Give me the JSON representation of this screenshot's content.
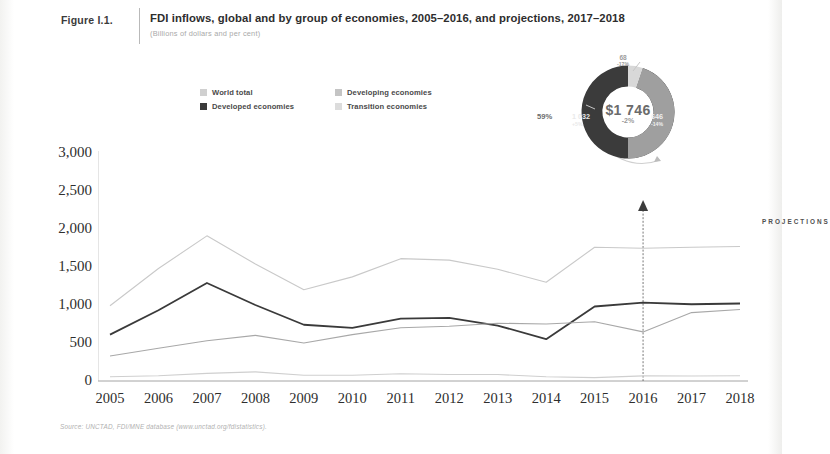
{
  "figure": {
    "label": "Figure I.1.",
    "title": "FDI inflows, global and by group of economies, 2005–2016, and projections, 2017–2018",
    "subtitle": "(Billions of dollars and per cent)",
    "source": "Source:  UNCTAD, FDI/MNE database (www.unctad.org/fdistatistics)."
  },
  "legend": {
    "items": [
      {
        "label": "World total",
        "color": "#d0d0d0"
      },
      {
        "label": "Developing economies",
        "color": "#c4c4c4"
      },
      {
        "label": "Developed economies",
        "color": "#3a3a3a"
      },
      {
        "label": "Transition economies",
        "color": "#dcdcdc"
      }
    ]
  },
  "donut": {
    "center_value": "$1 746",
    "center_change": "-2%",
    "left_percent": "59%",
    "segments": [
      {
        "name": "developed",
        "value": "1 032",
        "percent": "+5%"
      },
      {
        "name": "developing",
        "value": "646",
        "percent": "-14%"
      },
      {
        "name": "transition",
        "value": "68",
        "percent": "-17%"
      }
    ]
  },
  "annotations": {
    "projections": "PROJECTIONS"
  },
  "chart_data": {
    "type": "line",
    "title": "FDI inflows, global and by group of economies, 2005–2016, and projections, 2017–2018",
    "xlabel": "",
    "ylabel": "Billions of dollars",
    "x": [
      2005,
      2006,
      2007,
      2008,
      2009,
      2010,
      2011,
      2012,
      2013,
      2014,
      2015,
      2016,
      2017,
      2018
    ],
    "categories": [
      "2005",
      "2006",
      "2007",
      "2008",
      "2009",
      "2010",
      "2011",
      "2012",
      "2013",
      "2014",
      "2015",
      "2016",
      "2017",
      "2018"
    ],
    "ylim": [
      0,
      3000
    ],
    "yticks": [
      0,
      500,
      1000,
      1500,
      2000,
      2500,
      3000
    ],
    "ytick_labels": [
      "0",
      "500",
      "1,000",
      "1,500",
      "2,000",
      "2,500",
      "3,000"
    ],
    "grid": false,
    "legend_position": "top-left",
    "projection_start_year": 2016,
    "series": [
      {
        "name": "World total",
        "color": "#c9c9c9",
        "width": 1.1,
        "values": [
          990,
          1480,
          1910,
          1540,
          1200,
          1370,
          1610,
          1590,
          1470,
          1300,
          1760,
          1746,
          1760,
          1770
        ]
      },
      {
        "name": "Developed economies",
        "color": "#3a3a3a",
        "width": 1.8,
        "values": [
          610,
          930,
          1290,
          1000,
          740,
          700,
          820,
          830,
          730,
          550,
          980,
          1032,
          1010,
          1020
        ]
      },
      {
        "name": "Developing economies",
        "color": "#a8a8a8",
        "width": 1.1,
        "values": [
          330,
          430,
          530,
          600,
          500,
          610,
          700,
          720,
          760,
          750,
          780,
          646,
          900,
          940
        ]
      },
      {
        "name": "Transition economies",
        "color": "#cfcfcf",
        "width": 1.1,
        "values": [
          55,
          70,
          100,
          120,
          75,
          75,
          95,
          85,
          85,
          55,
          45,
          68,
          65,
          70
        ]
      }
    ]
  }
}
